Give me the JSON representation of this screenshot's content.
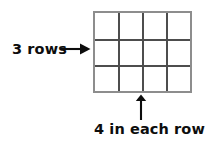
{
  "figure": {
    "type": "rectangular-array-diagram",
    "background_color": "#ffffff",
    "ink_color": "#0d0d0d",
    "grid": {
      "rows": 3,
      "columns": 4,
      "total_cells": 12,
      "border_color": "#8d8d8d",
      "line_color": "#4d4d4d",
      "cell_fill": "#ffffff"
    },
    "annotations": {
      "rows": {
        "text": "3 rows",
        "arrow": "arrow-right",
        "points_to": "grid-array",
        "position": "left"
      },
      "columns": {
        "text": "4 in each row",
        "arrow": "arrow-up",
        "points_to": "grid-array",
        "position": "bottom"
      }
    }
  }
}
